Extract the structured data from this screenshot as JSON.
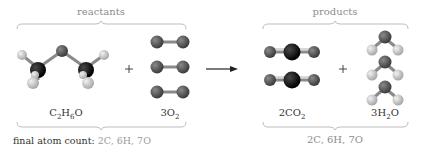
{
  "reactants": {
    "label": "reactants",
    "ethanol": {
      "formula_parts": [
        "C",
        "2",
        "H",
        "6",
        "O"
      ],
      "name": "C2H6O"
    },
    "oxygen": {
      "coefficient": "3",
      "formula_parts": [
        "O",
        "2"
      ],
      "name": "3O2"
    }
  },
  "plus_sign": "+",
  "arrow": "reaction-arrow",
  "products": {
    "label": "products",
    "co2": {
      "coefficient": "2",
      "formula_parts": [
        "CO",
        "2"
      ],
      "name": "2CO2"
    },
    "water": {
      "coefficient": "3",
      "formula_parts": [
        "H",
        "2",
        "O"
      ],
      "name": "3H2O"
    },
    "atom_count": "2C, 6H, 7O"
  },
  "final_count": {
    "label": "final atom count:",
    "value": "2C, 6H, 7O"
  },
  "colors": {
    "carbon": "#0a0a0a",
    "oxygen": "#5a5a5a",
    "hydrogen": "#c8c8c8",
    "bond": "#8a8a8a",
    "brace": "#bdbdbd"
  }
}
